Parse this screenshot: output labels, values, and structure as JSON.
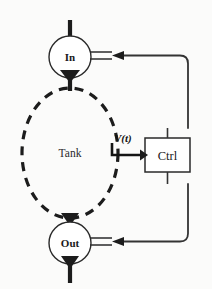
{
  "figure": {
    "background_color": "#fbfbfa",
    "line_color": "#1c1c1c",
    "width": 212,
    "height": 289
  },
  "nodes": {
    "inlet_valve": {
      "label": "In",
      "kind": "valve",
      "cx": 70,
      "cy": 57,
      "r": 21
    },
    "outlet_valve": {
      "label": "Out",
      "kind": "valve",
      "cx": 70,
      "cy": 243,
      "r": 21
    },
    "tank": {
      "label": "Tank",
      "kind": "vessel",
      "cx": 70,
      "cy": 153,
      "rx": 48,
      "ry": 65,
      "style": "dashed"
    },
    "controller": {
      "label": "Ctrl",
      "kind": "block",
      "x": 145,
      "y": 138,
      "width": 45,
      "height": 34
    }
  },
  "signals": {
    "measurement": {
      "label": "V(t)",
      "from": "tank",
      "to": "controller",
      "direction": "right"
    },
    "inlet_command": {
      "from": "controller",
      "to": "inlet_valve",
      "direction": "left"
    },
    "outlet_command": {
      "from": "controller",
      "to": "outlet_valve",
      "direction": "left"
    }
  }
}
